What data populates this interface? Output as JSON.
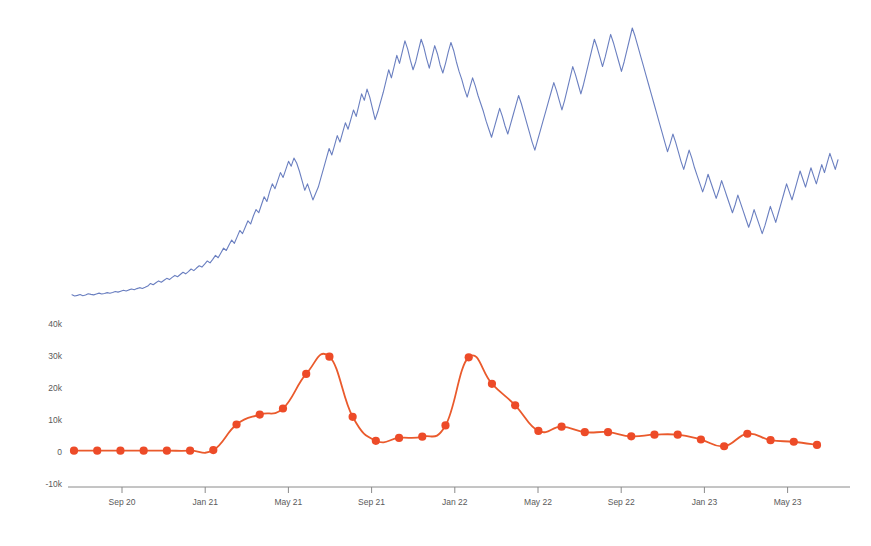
{
  "chart_data": [
    {
      "id": "price-panel",
      "type": "line",
      "title": "",
      "subtitle": "",
      "xlabel": "",
      "ylabel": "",
      "grid": false,
      "legend": "none",
      "axis_visible": false,
      "y_tick_labels": [],
      "x_tick_labels": [],
      "series": [
        {
          "name": "Price",
          "color": "#6a7fc0",
          "values": [
            5.0,
            4.2,
            4.6,
            5.1,
            4.4,
            4.8,
            5.6,
            5.2,
            4.9,
            5.5,
            6.0,
            5.4,
            5.8,
            6.3,
            5.9,
            6.4,
            7.0,
            6.6,
            7.2,
            7.8,
            7.3,
            8.0,
            8.6,
            8.1,
            8.8,
            9.4,
            8.9,
            9.6,
            10.4,
            12.0,
            11.2,
            12.4,
            13.6,
            12.8,
            14.0,
            15.2,
            14.4,
            15.8,
            17.0,
            16.2,
            17.6,
            19.0,
            18.0,
            19.4,
            21.0,
            20.0,
            21.6,
            23.0,
            22.2,
            24.0,
            26.0,
            24.8,
            27.0,
            29.5,
            28.0,
            31.0,
            34.0,
            32.5,
            36.0,
            39.0,
            37.0,
            41.0,
            45.0,
            43.0,
            47.0,
            51.0,
            49.0,
            54.0,
            58.0,
            56.0,
            61.0,
            66.0,
            63.0,
            69.0,
            74.0,
            71.0,
            76.0,
            81.0,
            78.0,
            83.0,
            88.0,
            85.0,
            90.0,
            87.0,
            82.0,
            76.0,
            70.0,
            74.0,
            69.0,
            64.0,
            68.0,
            72.0,
            78.0,
            84.0,
            90.0,
            96.0,
            92.0,
            98.0,
            104.0,
            100.0,
            106.0,
            112.0,
            108.0,
            114.0,
            120.0,
            116.0,
            123.0,
            130.0,
            126.0,
            133.0,
            128.0,
            121.0,
            114.0,
            119.0,
            125.0,
            131.0,
            138.0,
            145.0,
            140.0,
            147.0,
            154.0,
            149.0,
            156.0,
            163.0,
            158.0,
            151.0,
            145.0,
            150.0,
            157.0,
            164.0,
            159.0,
            152.0,
            146.0,
            153.0,
            160.0,
            155.0,
            148.0,
            143.0,
            149.0,
            156.0,
            162.0,
            157.0,
            150.0,
            144.0,
            139.0,
            133.0,
            128.0,
            134.0,
            140.0,
            135.0,
            129.0,
            124.0,
            119.0,
            113.0,
            108.0,
            103.0,
            109.0,
            115.0,
            121.0,
            116.0,
            110.0,
            105.0,
            111.0,
            117.0,
            123.0,
            129.0,
            124.0,
            118.0,
            112.0,
            106.0,
            100.0,
            95.0,
            101.0,
            107.0,
            113.0,
            119.0,
            125.0,
            131.0,
            137.0,
            132.0,
            126.0,
            120.0,
            126.0,
            133.0,
            140.0,
            147.0,
            142.0,
            136.0,
            130.0,
            136.0,
            143.0,
            150.0,
            157.0,
            164.0,
            159.0,
            153.0,
            147.0,
            153.0,
            160.0,
            167.0,
            162.0,
            156.0,
            150.0,
            144.0,
            150.0,
            157.0,
            164.0,
            171.0,
            166.0,
            160.0,
            154.0,
            148.0,
            142.0,
            136.0,
            130.0,
            124.0,
            118.0,
            112.0,
            106.0,
            100.0,
            94.0,
            99.0,
            105.0,
            100.0,
            94.0,
            88.0,
            83.0,
            89.0,
            95.0,
            90.0,
            84.0,
            79.0,
            74.0,
            69.0,
            74.0,
            80.0,
            75.0,
            70.0,
            65.0,
            70.0,
            76.0,
            71.0,
            66.0,
            61.0,
            56.0,
            61.0,
            67.0,
            62.0,
            57.0,
            52.0,
            47.0,
            52.0,
            58.0,
            53.0,
            48.0,
            43.0,
            48.0,
            54.0,
            60.0,
            55.0,
            50.0,
            56.0,
            62.0,
            68.0,
            74.0,
            69.0,
            64.0,
            70.0,
            76.0,
            82.0,
            77.0,
            72.0,
            78.0,
            84.0,
            79.0,
            74.0,
            80.0,
            86.0,
            81.0,
            87.0,
            93.0,
            88.0,
            83.0,
            89.0
          ]
        }
      ]
    },
    {
      "id": "volume-panel",
      "type": "line",
      "title": "",
      "subtitle": "",
      "xlabel": "",
      "ylabel": "",
      "grid": false,
      "legend": "none",
      "markers": true,
      "ylim": [
        -10000,
        40000
      ],
      "y_ticks": [
        40000,
        30000,
        20000,
        10000,
        0,
        -10000
      ],
      "y_tick_labels": [
        "40k",
        "30k",
        "20k",
        "10k",
        "0",
        "-10k"
      ],
      "x_tick_labels": [
        "Sep 20",
        "Jan 21",
        "May 21",
        "Sep 21",
        "Jan 22",
        "May 22",
        "Sep 22",
        "Jan 23",
        "May 23"
      ],
      "series": [
        {
          "name": "Volume",
          "color": "#ea5a2c",
          "marker_color": "#ed4b28",
          "categories": [
            "Jun 20",
            "Jul 20",
            "Aug 20",
            "Sep 20",
            "Oct 20",
            "Nov 20",
            "Dec 20",
            "Jan 21",
            "Feb 21",
            "Mar 21",
            "Apr 21",
            "May 21",
            "Jun 21",
            "Jul 21",
            "Aug 21",
            "Sep 21",
            "Oct 21",
            "Nov 21",
            "Dec 21",
            "Jan 22",
            "Feb 22",
            "Mar 22",
            "Apr 22",
            "May 22",
            "Jun 22",
            "Jul 22",
            "Aug 22",
            "Sep 22",
            "Oct 22",
            "Nov 22",
            "Dec 22",
            "Jan 23",
            "Feb 23",
            "Mar 23",
            "Apr 23",
            "May 23",
            "Jun 23"
          ],
          "values": [
            400,
            400,
            400,
            400,
            400,
            400,
            600,
            8600,
            11700,
            13600,
            24400,
            29800,
            11000,
            3500,
            4400,
            4800,
            8300,
            29600,
            21300,
            14600,
            6600,
            7900,
            6200,
            6200,
            4900,
            5400,
            5400,
            3900,
            1800,
            5700,
            3700,
            3200,
            2200
          ]
        }
      ]
    }
  ],
  "axis": {
    "y_tick_labels": [
      "40k",
      "30k",
      "20k",
      "10k",
      "0",
      "-10k"
    ],
    "x_tick_labels": [
      "Sep 20",
      "Jan 21",
      "May 21",
      "Sep 21",
      "Jan 22",
      "May 22",
      "Sep 22",
      "Jan 23",
      "May 23"
    ]
  },
  "colors": {
    "price_line": "#6a7fc0",
    "volume_line": "#ea5a2c",
    "volume_marker": "#ed4b28",
    "axis": "#8a8a8a",
    "tick_text": "#5a5a5a",
    "background": "#ffffff"
  }
}
